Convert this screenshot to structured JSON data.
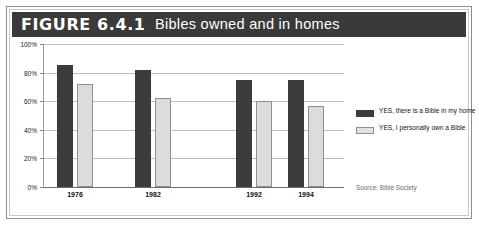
{
  "figure": {
    "number_label": "FIGURE 6.4.1",
    "caption": "Bibles owned and in homes",
    "source_note": "Source: Bible Society",
    "colors": {
      "title_bar": "#3a3a3a",
      "title_text": "#ffffff",
      "series_dark": "#3c3c3c",
      "series_light": "#dcdcdc",
      "gridline": "#bfbfbf",
      "axis": "#6e6e6e",
      "frame": "#8d8d8d"
    }
  },
  "chart_data": {
    "type": "bar",
    "title": "Bibles owned and in homes",
    "xlabel": "",
    "ylabel": "",
    "ylim": [
      0,
      100
    ],
    "yticks": [
      0,
      20,
      40,
      60,
      80,
      100
    ],
    "ytick_labels": [
      "0%",
      "20%",
      "40%",
      "60%",
      "80%",
      "100%"
    ],
    "grid": true,
    "legend_position": "right",
    "categories": [
      "1976",
      "1982",
      "1992",
      "1994"
    ],
    "series": [
      {
        "name": "YES, there is a Bible in my home",
        "color": "#3c3c3c",
        "values": [
          85,
          82,
          75,
          75
        ]
      },
      {
        "name": "YES, I personally own a Bible",
        "color": "#dcdcdc",
        "values": [
          72,
          62,
          60,
          57
        ]
      }
    ],
    "source": "Source: Bible Society"
  },
  "axis": {
    "y_labels": [
      "100%",
      "80%",
      "60%",
      "40%",
      "20%",
      "0%"
    ]
  },
  "legend": {
    "items": [
      {
        "label": "YES, there is a Bible in my home",
        "swatch": "dark"
      },
      {
        "label": "YES, I personally own a Bible",
        "swatch": "light"
      }
    ]
  }
}
